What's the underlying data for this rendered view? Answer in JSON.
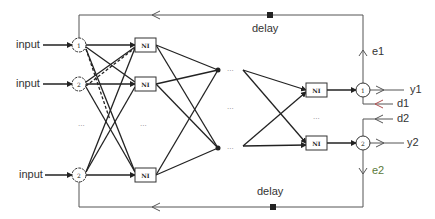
{
  "diagram": {
    "type": "recurrent-neural-network",
    "inputs": [
      {
        "label": "input",
        "node": "1"
      },
      {
        "label": "input",
        "node": "2"
      },
      {
        "label": "input",
        "node": "2"
      }
    ],
    "hidden_block_label": "NI",
    "ellipsis": "...",
    "outputs": [
      {
        "node": "1",
        "output_label": "y1",
        "target_label": "d1",
        "error_label": "e1"
      },
      {
        "node": "2",
        "output_label": "y2",
        "target_label": "d2",
        "error_label": "e2"
      }
    ],
    "feedback": {
      "top_delay_label": "delay",
      "bottom_delay_label": "delay"
    },
    "colors": {
      "line": "#333333",
      "d1_arrow": "#b05050",
      "e2_label": "#5a7a3a"
    }
  }
}
